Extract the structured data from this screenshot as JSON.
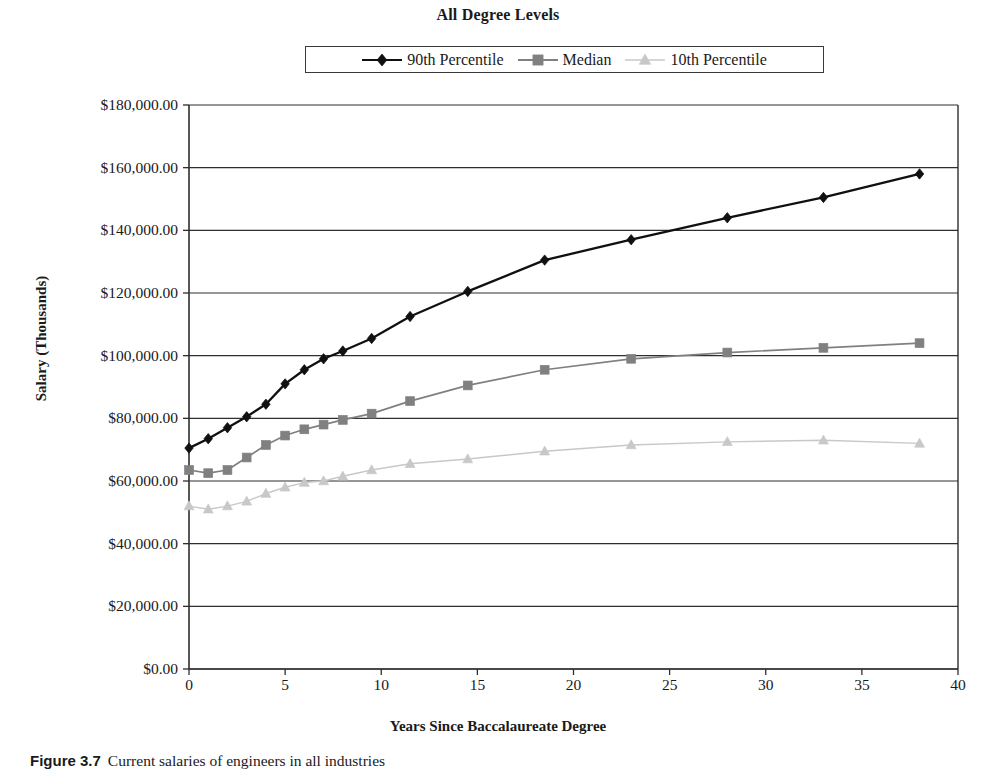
{
  "title": "All Degree Levels",
  "caption": {
    "figure_number": "Figure 3.7",
    "text": "Current salaries of engineers in all industries"
  },
  "legend": {
    "position": "top-center",
    "items": [
      {
        "label": "90th Percentile",
        "color": "#101010",
        "marker": "diamond"
      },
      {
        "label": "Median",
        "color": "#808080",
        "marker": "square"
      },
      {
        "label": "10th Percentile",
        "color": "#c8c8c8",
        "marker": "triangle"
      }
    ]
  },
  "axes": {
    "ylabel": "Salary (Thousands)",
    "xlabel": "Years Since Baccalaureate Degree",
    "yticks": [
      "$0.00",
      "$20,000.00",
      "$40,000.00",
      "$60,000.00",
      "$80,000.00",
      "$100,000.00",
      "$120,000.00",
      "$140,000.00",
      "$160,000.00",
      "$180,000.00"
    ],
    "xticks": [
      "0",
      "5",
      "10",
      "15",
      "20",
      "25",
      "30",
      "35",
      "40"
    ]
  },
  "chart_data": {
    "type": "line",
    "title": "All Degree Levels",
    "xlabel": "Years Since Baccalaureate Degree",
    "ylabel": "Salary (Thousands)",
    "xlim": [
      0,
      40
    ],
    "ylim": [
      0,
      180000
    ],
    "ytick_values": [
      0,
      20000,
      40000,
      60000,
      80000,
      100000,
      120000,
      140000,
      160000,
      180000
    ],
    "xtick_values": [
      0,
      5,
      10,
      15,
      20,
      25,
      30,
      35,
      40
    ],
    "grid": "horizontal",
    "legend_position": "top-center",
    "x": [
      0,
      1,
      2,
      3,
      4,
      5,
      6,
      7,
      8,
      9.5,
      11.5,
      14.5,
      18.5,
      23,
      28,
      33,
      38
    ],
    "series": [
      {
        "name": "90th Percentile",
        "color": "#101010",
        "marker": "diamond",
        "values": [
          70500,
          73500,
          77000,
          80500,
          84500,
          91000,
          95500,
          99000,
          101500,
          105500,
          112500,
          120500,
          130500,
          137000,
          144000,
          150500,
          158000
        ]
      },
      {
        "name": "Median",
        "color": "#808080",
        "marker": "square",
        "values": [
          63500,
          62500,
          63500,
          67500,
          71500,
          74500,
          76500,
          78000,
          79500,
          81500,
          85500,
          90500,
          95500,
          99000,
          101000,
          102500,
          104000
        ]
      },
      {
        "name": "10th Percentile",
        "color": "#c8c8c8",
        "marker": "triangle",
        "values": [
          52000,
          51000,
          52000,
          53500,
          56000,
          58000,
          59500,
          60000,
          61500,
          63500,
          65500,
          67000,
          69500,
          71500,
          72500,
          73000,
          72000
        ]
      }
    ]
  },
  "geometry": {
    "plot_left": 189,
    "plot_right": 958,
    "plot_top": 105,
    "plot_bottom": 669
  }
}
